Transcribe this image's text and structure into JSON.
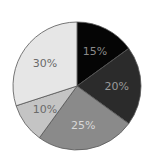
{
  "chart_data": {
    "type": "pie",
    "title": "",
    "categories": [
      "Slice 1",
      "Slice 2",
      "Slice 3",
      "Slice 4",
      "Slice 5"
    ],
    "values": [
      15,
      20,
      25,
      10,
      30
    ],
    "labels": [
      "15%",
      "20%",
      "25%",
      "10%",
      "30%"
    ],
    "colors": [
      "#050505",
      "#2b2b2b",
      "#8a8a8a",
      "#c4c4c4",
      "#e6e6e6"
    ],
    "label_colors": [
      "#8a8a8a",
      "#9a9a9a",
      "#d8d8d8",
      "#6a6a6a",
      "#6a6a6a"
    ],
    "start_angle_deg": 0,
    "direction": "clockwise",
    "legend": false,
    "center": [
      77,
      86
    ],
    "radius": 64,
    "stroke_color": "#555555"
  }
}
